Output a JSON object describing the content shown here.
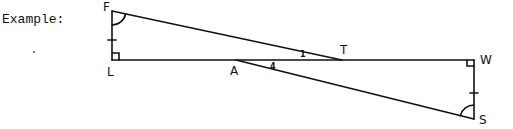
{
  "header": {
    "label": "Example:"
  },
  "figure": {
    "points": {
      "F": "F",
      "L": "L",
      "A": "A",
      "T": "T",
      "W": "W",
      "S": "S"
    },
    "angle_marks": {
      "angle_1": "1",
      "angle_4": "4"
    },
    "segments": [
      "FL",
      "LW",
      "FT",
      "AS",
      "WS"
    ],
    "right_angles": [
      "L",
      "W"
    ],
    "congruent_sides": [
      "FL",
      "WS"
    ],
    "congruent_angles": [
      "F",
      "S"
    ],
    "line_color": "#111111"
  }
}
